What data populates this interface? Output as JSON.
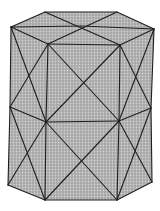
{
  "figure": {
    "colors": {
      "background": "#ffffff",
      "fill": "#a9a9a9",
      "fill_light": "#c4c4c4",
      "edge": "#1e1e1e"
    },
    "labels": []
  }
}
